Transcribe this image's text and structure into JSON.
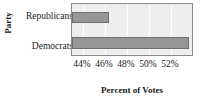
{
  "chart_data": {
    "type": "bar",
    "orientation": "horizontal",
    "title": "",
    "xlabel": "Percent of Votes",
    "ylabel": "Party",
    "categories": [
      "Republicans",
      "Democrats"
    ],
    "values": [
      46.4,
      53.6
    ],
    "xlim": [
      43.0,
      54.1
    ],
    "xticks": [
      44,
      46,
      48,
      50,
      52
    ],
    "xtick_labels": [
      "44%",
      "46%",
      "48%",
      "50%",
      "52%"
    ],
    "grid": true,
    "gridlines": "vertical",
    "legend": "none",
    "colors": {
      "bar_fill": "#969696",
      "bar_edge": "#6e6e6e",
      "plot_background": "#eeeeee",
      "gridline": "#ffffff",
      "axis_border": "#8a8a8a",
      "text": "#1a1a1a",
      "figure_background": "#ffffff"
    }
  }
}
